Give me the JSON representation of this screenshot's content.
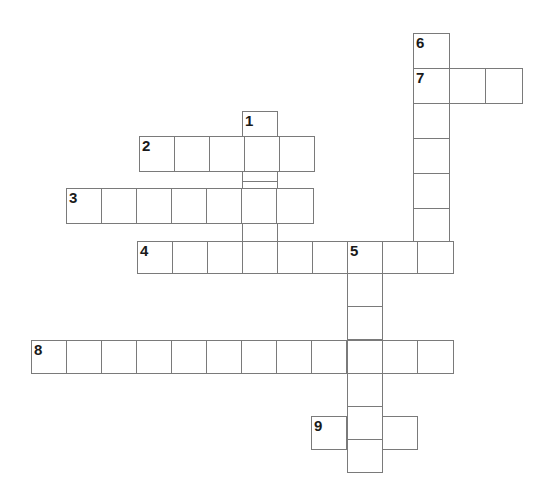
{
  "puzzle": {
    "type": "crossword-grid",
    "title": "Crossword Puzzle",
    "background_color": "#ffffff",
    "cell_border_color": "#7a7a7a",
    "number_color": "#1a1a1a",
    "cell_size": 35.2,
    "origin_x": 31,
    "origin_y": 33,
    "grid_columns": 14,
    "grid_rows": 13,
    "total_cells": 52,
    "entries": [
      {
        "number": "1",
        "direction": "down",
        "length": 5,
        "start_col": 6,
        "start_row": 2,
        "x": 242,
        "y": 111
      },
      {
        "number": "2",
        "direction": "across",
        "length": 5,
        "start_col": 3,
        "start_row": 3,
        "x": 139,
        "y": 136
      },
      {
        "number": "3",
        "direction": "across",
        "length": 7,
        "start_col": 1,
        "start_row": 4,
        "x": 66,
        "y": 188
      },
      {
        "number": "4",
        "direction": "across",
        "length": 9,
        "start_col": 3,
        "start_row": 5,
        "x": 137,
        "y": 241
      },
      {
        "number": "5",
        "direction": "down",
        "length": 7,
        "start_col": 9,
        "start_row": 5,
        "x": 347,
        "y": 241
      },
      {
        "number": "6",
        "direction": "down",
        "length": 8,
        "start_col": 11,
        "start_row": 0,
        "x": 413,
        "y": 33
      },
      {
        "number": "7",
        "direction": "across",
        "length": 3,
        "start_col": 11,
        "start_row": 1,
        "x": 413,
        "y": 68
      },
      {
        "number": "8",
        "direction": "across",
        "length": 12,
        "start_col": 0,
        "start_row": 8,
        "x": 31,
        "y": 340
      },
      {
        "number": "9",
        "direction": "across",
        "length": 3,
        "start_col": 8,
        "start_row": 10,
        "x": 311,
        "y": 416
      }
    ],
    "cells": [
      {
        "x": 413,
        "y": 33,
        "w": 37,
        "h": 36,
        "number": "6"
      },
      {
        "x": 413,
        "y": 68,
        "w": 37,
        "h": 36,
        "number": "7"
      },
      {
        "x": 449,
        "y": 68,
        "w": 37,
        "h": 36,
        "number": ""
      },
      {
        "x": 485,
        "y": 68,
        "w": 38,
        "h": 36,
        "number": ""
      },
      {
        "x": 413,
        "y": 103,
        "w": 37,
        "h": 36,
        "number": ""
      },
      {
        "x": 413,
        "y": 138,
        "w": 37,
        "h": 36,
        "number": ""
      },
      {
        "x": 413,
        "y": 173,
        "w": 37,
        "h": 36,
        "number": ""
      },
      {
        "x": 413,
        "y": 208,
        "w": 37,
        "h": 34,
        "number": ""
      },
      {
        "x": 242,
        "y": 111,
        "w": 36,
        "h": 36,
        "number": "1"
      },
      {
        "x": 242,
        "y": 146,
        "w": 36,
        "h": 36,
        "number": ""
      },
      {
        "x": 242,
        "y": 181,
        "w": 36,
        "h": 36,
        "number": ""
      },
      {
        "x": 242,
        "y": 216,
        "w": 36,
        "h": 36,
        "number": ""
      },
      {
        "x": 242,
        "y": 241,
        "w": 36,
        "h": 32,
        "number": ""
      },
      {
        "x": 139,
        "y": 136,
        "w": 36,
        "h": 36,
        "number": "2"
      },
      {
        "x": 174,
        "y": 136,
        "w": 36,
        "h": 36,
        "number": ""
      },
      {
        "x": 209,
        "y": 136,
        "w": 36,
        "h": 36,
        "number": ""
      },
      {
        "x": 244,
        "y": 136,
        "w": 36,
        "h": 36,
        "number": ""
      },
      {
        "x": 279,
        "y": 136,
        "w": 36,
        "h": 36,
        "number": ""
      },
      {
        "x": 66,
        "y": 188,
        "w": 36,
        "h": 36,
        "number": "3"
      },
      {
        "x": 101,
        "y": 188,
        "w": 36,
        "h": 36,
        "number": ""
      },
      {
        "x": 136,
        "y": 188,
        "w": 36,
        "h": 36,
        "number": ""
      },
      {
        "x": 171,
        "y": 188,
        "w": 36,
        "h": 36,
        "number": ""
      },
      {
        "x": 206,
        "y": 188,
        "w": 36,
        "h": 36,
        "number": ""
      },
      {
        "x": 241,
        "y": 188,
        "w": 36,
        "h": 36,
        "number": ""
      },
      {
        "x": 276,
        "y": 188,
        "w": 38,
        "h": 36,
        "number": ""
      },
      {
        "x": 137,
        "y": 241,
        "w": 36,
        "h": 33,
        "number": "4"
      },
      {
        "x": 172,
        "y": 241,
        "w": 36,
        "h": 33,
        "number": ""
      },
      {
        "x": 207,
        "y": 241,
        "w": 36,
        "h": 33,
        "number": ""
      },
      {
        "x": 242,
        "y": 241,
        "w": 36,
        "h": 33,
        "number": ""
      },
      {
        "x": 277,
        "y": 241,
        "w": 36,
        "h": 33,
        "number": ""
      },
      {
        "x": 312,
        "y": 241,
        "w": 36,
        "h": 33,
        "number": ""
      },
      {
        "x": 347,
        "y": 241,
        "w": 36,
        "h": 33,
        "number": "5"
      },
      {
        "x": 382,
        "y": 241,
        "w": 36,
        "h": 33,
        "number": ""
      },
      {
        "x": 417,
        "y": 241,
        "w": 37,
        "h": 33,
        "number": ""
      },
      {
        "x": 347,
        "y": 273,
        "w": 36,
        "h": 34,
        "number": ""
      },
      {
        "x": 347,
        "y": 306,
        "w": 36,
        "h": 34,
        "number": ""
      },
      {
        "x": 347,
        "y": 340,
        "w": 36,
        "h": 34,
        "number": ""
      },
      {
        "x": 347,
        "y": 373,
        "w": 36,
        "h": 34,
        "number": ""
      },
      {
        "x": 347,
        "y": 406,
        "w": 36,
        "h": 34,
        "number": ""
      },
      {
        "x": 347,
        "y": 439,
        "w": 36,
        "h": 34,
        "number": ""
      },
      {
        "x": 31,
        "y": 340,
        "w": 36,
        "h": 34,
        "number": "8"
      },
      {
        "x": 66,
        "y": 340,
        "w": 36,
        "h": 34,
        "number": ""
      },
      {
        "x": 101,
        "y": 340,
        "w": 36,
        "h": 34,
        "number": ""
      },
      {
        "x": 136,
        "y": 340,
        "w": 36,
        "h": 34,
        "number": ""
      },
      {
        "x": 171,
        "y": 340,
        "w": 36,
        "h": 34,
        "number": ""
      },
      {
        "x": 206,
        "y": 340,
        "w": 36,
        "h": 34,
        "number": ""
      },
      {
        "x": 241,
        "y": 340,
        "w": 36,
        "h": 34,
        "number": ""
      },
      {
        "x": 276,
        "y": 340,
        "w": 36,
        "h": 34,
        "number": ""
      },
      {
        "x": 311,
        "y": 340,
        "w": 36,
        "h": 34,
        "number": ""
      },
      {
        "x": 382,
        "y": 340,
        "w": 36,
        "h": 34,
        "number": ""
      },
      {
        "x": 417,
        "y": 340,
        "w": 37,
        "h": 34,
        "number": ""
      },
      {
        "x": 311,
        "y": 416,
        "w": 36,
        "h": 34,
        "number": "9"
      },
      {
        "x": 382,
        "y": 416,
        "w": 36,
        "h": 34,
        "number": ""
      }
    ]
  }
}
